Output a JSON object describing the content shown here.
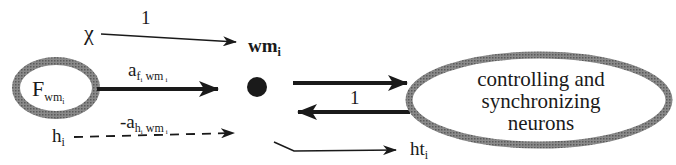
{
  "diagram": {
    "type": "neural-connection-diagram",
    "nodes": {
      "input_f": {
        "label": "F",
        "subscript": "wm",
        "subsubscript": "i",
        "shape": "ellipse-thick-gray"
      },
      "wm": {
        "label": "wm",
        "subscript": "i",
        "shape": "filled-dot"
      },
      "controller": {
        "lines": [
          "controlling and",
          "synchronizing",
          "neurons"
        ],
        "shape": "ellipse-thick-gray"
      }
    },
    "edges": {
      "chi_to_wm": {
        "source": "χ",
        "weight": "1",
        "style": "thin-solid"
      },
      "f_to_wm": {
        "weight_main": "a",
        "weight_sub": "f",
        "weight_subsub": "i",
        "weight_sub2": "wm",
        "weight_sub2sub": "i",
        "style": "thick-solid"
      },
      "h_to_wm": {
        "source": "h",
        "source_sub": "i",
        "weight_main": "-a",
        "weight_sub": "h",
        "weight_subsub": "i",
        "weight_sub2": "wm",
        "weight_sub2sub": "i",
        "style": "dashed"
      },
      "wm_to_controller": {
        "style": "thick-solid"
      },
      "controller_to_wm": {
        "weight": "1",
        "style": "thick-solid"
      },
      "wm_to_ht": {
        "target": "ht",
        "target_sub": "i",
        "style": "thin-solid"
      }
    },
    "colors": {
      "stroke": "#1a1a1a",
      "ellipse_border": "#7a7a7a",
      "background": "#ffffff"
    }
  }
}
